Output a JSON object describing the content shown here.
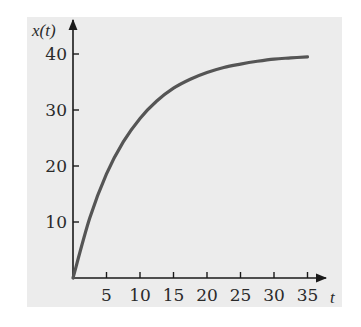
{
  "chart_data": {
    "type": "line",
    "title": "",
    "xlabel": "t",
    "ylabel": "x(t)",
    "xlim": [
      0,
      37
    ],
    "ylim": [
      0,
      44
    ],
    "grid": false,
    "x_ticks": [
      5,
      10,
      15,
      20,
      25,
      30,
      35
    ],
    "y_ticks": [
      10,
      20,
      30,
      40
    ],
    "series": [
      {
        "name": "x(t)",
        "x": [
          0,
          2.5,
          5,
          7.5,
          10,
          12.5,
          15,
          17.5,
          20,
          22.5,
          25,
          27.5,
          30,
          32.5,
          35
        ],
        "values": [
          0,
          10.7,
          18.6,
          24.3,
          28.5,
          31.6,
          33.9,
          35.5,
          36.7,
          37.6,
          38.2,
          38.7,
          39.1,
          39.3,
          39.5
        ]
      }
    ],
    "colors": {
      "curve": "#555555",
      "axes": "#1a1a1a",
      "panel": "#ececec"
    }
  },
  "labels": {
    "y_axis": "x(t)",
    "x_axis": "t",
    "x_ticks": [
      "5",
      "10",
      "15",
      "20",
      "25",
      "30",
      "35"
    ],
    "y_ticks": [
      "10",
      "20",
      "30",
      "40"
    ]
  }
}
